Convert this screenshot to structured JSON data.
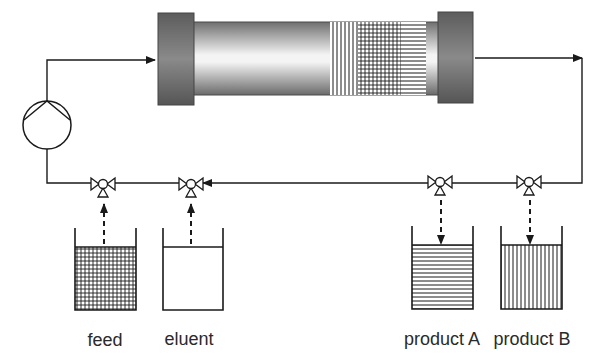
{
  "diagram": {
    "colors": {
      "line": "#1a1a1a",
      "end_cap": "#6e6e6e",
      "tube_dark": "#7a7a7a",
      "tube_light": "#f2f2f2",
      "background": "#ffffff"
    },
    "components": {
      "column": {
        "name": "chromatography column",
        "bands": [
          "vertical-lines",
          "grid",
          "horizontal-lines"
        ]
      },
      "pump": {
        "name": "pump"
      },
      "valves": [
        {
          "id": "valve-feed",
          "connects": "feed",
          "flow": "into loop"
        },
        {
          "id": "valve-eluent",
          "connects": "eluent",
          "flow": "into loop"
        },
        {
          "id": "valve-product-a",
          "connects": "product A",
          "flow": "out of loop"
        },
        {
          "id": "valve-product-b",
          "connects": "product B",
          "flow": "out of loop"
        }
      ]
    },
    "vessels": [
      {
        "id": "feed",
        "label": "feed",
        "fill": "grid"
      },
      {
        "id": "eluent",
        "label": "eluent",
        "fill": "empty"
      },
      {
        "id": "product-a",
        "label": "product A",
        "fill": "horizontal-lines"
      },
      {
        "id": "product-b",
        "label": "product B",
        "fill": "vertical-lines"
      }
    ]
  }
}
